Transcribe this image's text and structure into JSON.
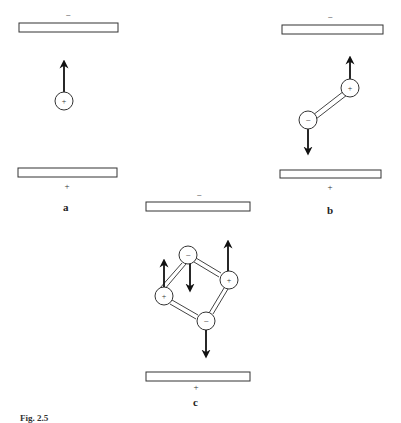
{
  "figure": {
    "panels": [
      {
        "id": "a",
        "label": "a",
        "top_plate_sign": "−",
        "bottom_plate_sign": "+",
        "charges": [
          {
            "sign": "+",
            "cx": 64,
            "cy": 101,
            "arrow": "up"
          }
        ]
      },
      {
        "id": "b",
        "label": "b",
        "top_plate_sign": "−",
        "bottom_plate_sign": "+",
        "charges": [
          {
            "sign": "+",
            "cx": 350,
            "cy": 88,
            "arrow": "up"
          },
          {
            "sign": "−",
            "cx": 308,
            "cy": 120,
            "arrow": "down"
          }
        ],
        "bonds": [
          [
            "+",
            "−"
          ]
        ]
      },
      {
        "id": "c",
        "label": "c",
        "top_plate_sign": "−",
        "bottom_plate_sign": "+",
        "charges": [
          {
            "sign": "−",
            "cx": 188,
            "cy": 255,
            "arrow": "down"
          },
          {
            "sign": "+",
            "cx": 229,
            "cy": 280,
            "arrow": "up"
          },
          {
            "sign": "+",
            "cx": 164,
            "cy": 296,
            "arrow": "up"
          },
          {
            "sign": "−",
            "cx": 206,
            "cy": 321,
            "arrow": "down"
          }
        ]
      }
    ],
    "caption": {
      "prefix": "Fig. 2.5",
      "text": ""
    }
  }
}
